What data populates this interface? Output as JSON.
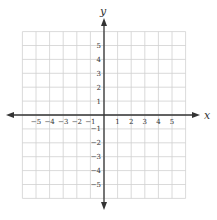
{
  "diagram": {
    "type": "coordinate-plane",
    "x_axis_label": "x",
    "y_axis_label": "y",
    "x_range": [
      -6,
      6
    ],
    "y_range": [
      -6,
      6
    ],
    "x_ticks": [
      "−5",
      "−4",
      "−3",
      "−2",
      "−1",
      "1",
      "2",
      "3",
      "4",
      "5"
    ],
    "y_ticks": [
      "5",
      "4",
      "3",
      "2",
      "1",
      "−1",
      "−2",
      "−3",
      "−4",
      "−5"
    ],
    "colors": {
      "grid": "#d0d0d0",
      "axis": "#333333",
      "text": "#333333",
      "background": "#ffffff"
    }
  }
}
